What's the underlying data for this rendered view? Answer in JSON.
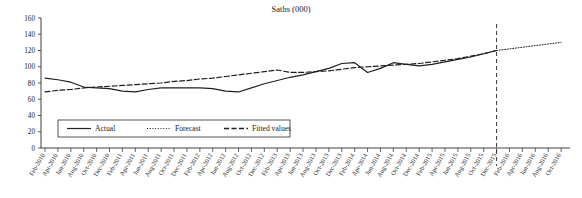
{
  "chart_data": {
    "type": "line",
    "title": "Saths (000)",
    "xlabel": "",
    "ylabel": "",
    "ylim": [
      0,
      160
    ],
    "yticks": [
      0,
      20,
      40,
      60,
      80,
      100,
      120,
      140,
      160
    ],
    "grid": false,
    "legend_position": "bottom-left",
    "legend": [
      {
        "name": "Actual",
        "style": "solid"
      },
      {
        "name": "Forecast",
        "style": "dotted"
      },
      {
        "name": "Fitted values",
        "style": "dashed"
      }
    ],
    "tick_labels": [
      "Feb-2010",
      "Apr-2010",
      "Jun-2010",
      "Aug-2010",
      "Oct-2010",
      "Dec-2010",
      "Feb-2011",
      "Apr-2011",
      "Jun-2011",
      "Aug-2011",
      "Oct-2011",
      "Dec-2011",
      "Feb-2012",
      "Apr-2012",
      "Jun-2012",
      "Aug-2012",
      "Oct-2012",
      "Dec-2012",
      "Feb-2013",
      "Apr-2013",
      "Jun-2013",
      "Aug-2013",
      "Oct-2013",
      "Dec-2013",
      "Feb-2014",
      "Apr-2014",
      "Jun-2014",
      "Aug-2014",
      "Oct-2014",
      "Dec-2014",
      "Feb-2015",
      "Apr-2015",
      "Jun-2015",
      "Aug-2015",
      "Oct-2015",
      "Dec-2015",
      "Feb-2016",
      "Apr-2016",
      "Jun-2016",
      "Aug-2016",
      "Oct-2016"
    ],
    "forecast_start_label": "Dec-2015",
    "forecast_divider_x_label": "Dec-2015",
    "series": [
      {
        "name": "Actual",
        "style": "solid",
        "x": [
          "Feb-2010",
          "Apr-2010",
          "Jun-2010",
          "Aug-2010",
          "Oct-2010",
          "Dec-2010",
          "Feb-2011",
          "Apr-2011",
          "Jun-2011",
          "Aug-2011",
          "Oct-2011",
          "Dec-2011",
          "Feb-2012",
          "Apr-2012",
          "Jun-2012",
          "Aug-2012",
          "Oct-2012",
          "Dec-2012",
          "Feb-2013",
          "Apr-2013",
          "Jun-2013",
          "Aug-2013",
          "Oct-2013",
          "Dec-2013",
          "Feb-2014",
          "Apr-2014",
          "Jun-2014",
          "Aug-2014",
          "Oct-2014",
          "Dec-2014",
          "Feb-2015",
          "Apr-2015",
          "Jun-2015",
          "Aug-2015",
          "Oct-2015",
          "Dec-2015"
        ],
        "values": [
          86,
          84,
          81,
          75,
          74,
          73,
          70,
          69,
          72,
          74,
          74,
          74,
          74,
          73,
          70,
          69,
          74,
          79,
          83,
          87,
          90,
          94,
          98,
          104,
          105,
          93,
          98,
          105,
          103,
          101,
          103,
          106,
          109,
          112,
          116,
          120
        ]
      },
      {
        "name": "Fitted values",
        "style": "dashed",
        "x": [
          "Feb-2010",
          "Apr-2010",
          "Jun-2010",
          "Aug-2010",
          "Oct-2010",
          "Dec-2010",
          "Feb-2011",
          "Apr-2011",
          "Jun-2011",
          "Aug-2011",
          "Oct-2011",
          "Dec-2011",
          "Feb-2012",
          "Apr-2012",
          "Jun-2012",
          "Aug-2012",
          "Oct-2012",
          "Dec-2012",
          "Feb-2013",
          "Apr-2013",
          "Jun-2013",
          "Aug-2013",
          "Oct-2013",
          "Dec-2013",
          "Feb-2014",
          "Apr-2014",
          "Jun-2014",
          "Aug-2014",
          "Oct-2014",
          "Dec-2014",
          "Feb-2015",
          "Apr-2015",
          "Jun-2015",
          "Aug-2015",
          "Oct-2015",
          "Dec-2015"
        ],
        "values": [
          69,
          71,
          72,
          74,
          75,
          76,
          77,
          78,
          79,
          80,
          82,
          83,
          85,
          86,
          88,
          90,
          92,
          94,
          96,
          93,
          93,
          94,
          95,
          97,
          99,
          100,
          101,
          102,
          103,
          104,
          106,
          108,
          110,
          113,
          116,
          120
        ]
      },
      {
        "name": "Forecast",
        "style": "dotted",
        "x": [
          "Dec-2015",
          "Feb-2016",
          "Apr-2016",
          "Jun-2016",
          "Aug-2016",
          "Oct-2016"
        ],
        "values": [
          120,
          122,
          124,
          126,
          128,
          130
        ]
      }
    ]
  }
}
